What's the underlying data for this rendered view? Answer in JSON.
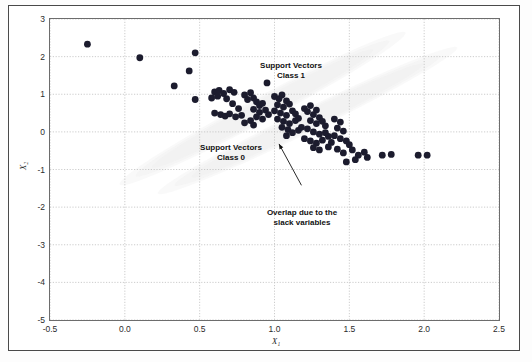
{
  "figure": {
    "background_color": "#ffffff",
    "frame_color": "#4a4a4a"
  },
  "annotations": [
    {
      "id": "support-vectors-class-1",
      "line1": "Support Vectors",
      "line2": "Class 1"
    },
    {
      "id": "support-vectors-class-0",
      "line1": "Support Vectors",
      "line2": "Class 0"
    },
    {
      "id": "overlap-slack",
      "line1": "Overlap due to the",
      "line2": "slack variables"
    }
  ],
  "chart_data": {
    "type": "scatter",
    "title": "",
    "xlabel": "X₁",
    "ylabel": "X₂",
    "xlim": [
      -0.5,
      2.5
    ],
    "ylim": [
      -5,
      3
    ],
    "xticks": [
      "-0.5",
      "0.0",
      "0.5",
      "1.0",
      "1.5",
      "2.0",
      "2.5"
    ],
    "xtick_values": [
      -0.5,
      0.0,
      0.5,
      1.0,
      1.5,
      2.0,
      2.5
    ],
    "yticks": [
      "3",
      "2",
      "1",
      "0",
      "-1",
      "-2",
      "-3",
      "-4",
      "-5"
    ],
    "ytick_values": [
      3,
      2,
      1,
      0,
      -1,
      -2,
      -3,
      -4,
      -5
    ],
    "grid": true,
    "grid_style": "dotted",
    "grid_color": "#bfbfbf",
    "legend": "none",
    "marker_color": "#1c1c2e",
    "marker_size_px": 3.4,
    "shaded_regions": [
      {
        "name": "class-0-density-ellipse",
        "color": "#e9e9e9",
        "opacity": 0.85,
        "cx": 0.92,
        "cy": 0.62,
        "rx": 1.02,
        "ry": 0.3,
        "angle_deg": -28
      },
      {
        "name": "class-1-density-ellipse",
        "color": "#ececec",
        "opacity": 0.85,
        "cx": 1.22,
        "cy": 0.3,
        "rx": 1.05,
        "ry": 0.28,
        "angle_deg": -26
      }
    ],
    "leader_lines": [
      {
        "name": "overlap-pointer",
        "from_x": 1.18,
        "from_y": -1.42,
        "to_x": 1.03,
        "to_y": -0.32
      }
    ],
    "points": [
      [
        -0.25,
        2.33
      ],
      [
        0.1,
        1.97
      ],
      [
        0.47,
        2.1
      ],
      [
        0.43,
        1.62
      ],
      [
        0.33,
        1.22
      ],
      [
        0.47,
        0.86
      ],
      [
        0.6,
        1.06
      ],
      [
        0.63,
        1.1
      ],
      [
        0.58,
        0.9
      ],
      [
        0.62,
        0.95
      ],
      [
        0.66,
        1.02
      ],
      [
        0.7,
        1.12
      ],
      [
        0.73,
        1.05
      ],
      [
        0.68,
        0.88
      ],
      [
        0.72,
        0.75
      ],
      [
        0.76,
        0.62
      ],
      [
        0.6,
        0.5
      ],
      [
        0.64,
        0.46
      ],
      [
        0.67,
        0.42
      ],
      [
        0.7,
        0.48
      ],
      [
        0.74,
        0.4
      ],
      [
        0.78,
        0.44
      ],
      [
        0.8,
        0.98
      ],
      [
        0.84,
        1.04
      ],
      [
        0.86,
        0.9
      ],
      [
        0.82,
        0.86
      ],
      [
        0.88,
        0.8
      ],
      [
        0.9,
        0.7
      ],
      [
        0.92,
        0.76
      ],
      [
        0.86,
        0.6
      ],
      [
        0.9,
        0.52
      ],
      [
        0.94,
        0.58
      ],
      [
        0.96,
        0.46
      ],
      [
        0.88,
        0.4
      ],
      [
        0.92,
        0.34
      ],
      [
        0.84,
        0.3
      ],
      [
        0.8,
        0.24
      ],
      [
        0.86,
        0.18
      ],
      [
        0.95,
        1.3
      ],
      [
        1.0,
        0.94
      ],
      [
        1.03,
        0.88
      ],
      [
        1.05,
        0.98
      ],
      [
        1.08,
        0.82
      ],
      [
        1.02,
        0.72
      ],
      [
        1.06,
        0.66
      ],
      [
        1.1,
        0.74
      ],
      [
        1.0,
        0.56
      ],
      [
        1.04,
        0.5
      ],
      [
        1.08,
        0.44
      ],
      [
        1.12,
        0.56
      ],
      [
        1.14,
        0.48
      ],
      [
        1.02,
        0.34
      ],
      [
        1.06,
        0.28
      ],
      [
        1.1,
        0.22
      ],
      [
        1.14,
        0.3
      ],
      [
        1.16,
        0.36
      ],
      [
        1.05,
        0.12
      ],
      [
        1.09,
        0.06
      ],
      [
        1.12,
        -0.02
      ],
      [
        1.16,
        0.04
      ],
      [
        1.18,
        0.12
      ],
      [
        1.08,
        -0.1
      ],
      [
        1.2,
        0.62
      ],
      [
        1.24,
        0.7
      ],
      [
        1.22,
        0.54
      ],
      [
        1.26,
        0.46
      ],
      [
        1.28,
        0.58
      ],
      [
        1.3,
        0.38
      ],
      [
        1.24,
        0.3
      ],
      [
        1.28,
        0.22
      ],
      [
        1.32,
        0.28
      ],
      [
        1.34,
        0.16
      ],
      [
        1.22,
        0.08
      ],
      [
        1.26,
        0.0
      ],
      [
        1.3,
        -0.06
      ],
      [
        1.34,
        -0.02
      ],
      [
        1.36,
        -0.12
      ],
      [
        1.2,
        -0.18
      ],
      [
        1.24,
        -0.24
      ],
      [
        1.28,
        -0.3
      ],
      [
        1.32,
        -0.22
      ],
      [
        1.38,
        -0.28
      ],
      [
        1.4,
        0.34
      ],
      [
        1.44,
        0.26
      ],
      [
        1.42,
        0.1
      ],
      [
        1.46,
        0.02
      ],
      [
        1.4,
        -0.1
      ],
      [
        1.44,
        -0.18
      ],
      [
        1.48,
        -0.24
      ],
      [
        1.5,
        -0.34
      ],
      [
        1.36,
        -0.4
      ],
      [
        1.42,
        -0.46
      ],
      [
        1.3,
        -0.48
      ],
      [
        1.26,
        -0.42
      ],
      [
        1.46,
        -0.56
      ],
      [
        1.52,
        -0.48
      ],
      [
        1.56,
        -0.62
      ],
      [
        1.6,
        -0.54
      ],
      [
        1.62,
        -0.68
      ],
      [
        1.54,
        -0.74
      ],
      [
        1.48,
        -0.8
      ],
      [
        1.72,
        -0.62
      ],
      [
        1.78,
        -0.6
      ],
      [
        1.96,
        -0.62
      ],
      [
        2.02,
        -0.62
      ]
    ]
  }
}
